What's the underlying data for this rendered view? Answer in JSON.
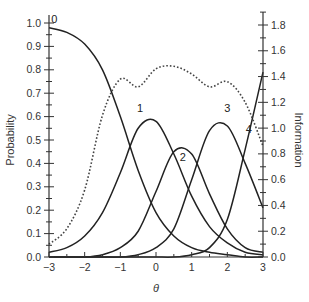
{
  "chart_data": {
    "type": "line",
    "title": "",
    "xlabel": "θ",
    "ylabel_left": "Probability",
    "ylabel_right": "Information",
    "xlim": [
      -3,
      3
    ],
    "ylim_left": [
      0,
      1.0
    ],
    "ylim_right": [
      0,
      1.9
    ],
    "x_ticks": [
      -3,
      -2,
      -1,
      0,
      1,
      2,
      3
    ],
    "x_tick_labels": [
      "−3",
      "−2",
      "−1",
      "0",
      "1",
      "2",
      "3"
    ],
    "y_left_ticks": [
      0.0,
      0.1,
      0.2,
      0.3,
      0.4,
      0.5,
      0.6,
      0.7,
      0.8,
      0.9,
      1.0
    ],
    "y_left_tick_labels": [
      "0.0",
      "0.1",
      "0.2",
      "0.3",
      "0.4",
      "0.5",
      "0.6",
      "0.7",
      "0.8",
      "0.9",
      "1.0"
    ],
    "y_right_ticks": [
      0.0,
      0.2,
      0.4,
      0.6,
      0.8,
      1.0,
      1.2,
      1.4,
      1.6,
      1.8
    ],
    "y_right_tick_labels": [
      "0.0",
      "0.2",
      "0.4",
      "0.6",
      "0.8",
      "1.0",
      "1.2",
      "1.4",
      "1.6",
      "1.8"
    ],
    "grid": false,
    "legend": "none (curves labeled inline)",
    "x": [
      -3.0,
      -2.5,
      -2.0,
      -1.5,
      -1.0,
      -0.5,
      0.0,
      0.5,
      1.0,
      1.5,
      2.0,
      2.5,
      3.0
    ],
    "series": [
      {
        "name": "0",
        "axis": "left",
        "style": "solid",
        "label_pos": [
          -2.85,
          1.0
        ],
        "values": [
          0.98,
          0.96,
          0.91,
          0.8,
          0.6,
          0.37,
          0.19,
          0.09,
          0.04,
          0.02,
          0.01,
          0.0,
          0.0
        ]
      },
      {
        "name": "1",
        "axis": "left",
        "style": "solid",
        "label_pos": [
          -0.45,
          0.62
        ],
        "values": [
          0.02,
          0.04,
          0.09,
          0.19,
          0.36,
          0.55,
          0.58,
          0.44,
          0.26,
          0.13,
          0.06,
          0.02,
          0.01
        ]
      },
      {
        "name": "2",
        "axis": "left",
        "style": "solid",
        "label_pos": [
          0.75,
          0.41
        ],
        "values": [
          0.0,
          0.0,
          0.0,
          0.01,
          0.04,
          0.11,
          0.28,
          0.45,
          0.44,
          0.27,
          0.12,
          0.04,
          0.02
        ]
      },
      {
        "name": "3",
        "axis": "left",
        "style": "solid",
        "label_pos": [
          2.0,
          0.62
        ],
        "values": [
          0.0,
          0.0,
          0.0,
          0.0,
          0.0,
          0.01,
          0.04,
          0.12,
          0.33,
          0.54,
          0.56,
          0.4,
          0.21
        ]
      },
      {
        "name": "4",
        "axis": "left",
        "style": "solid",
        "label_pos": [
          2.6,
          0.53
        ],
        "values": [
          0.0,
          0.0,
          0.0,
          0.0,
          0.0,
          0.0,
          0.0,
          0.0,
          0.01,
          0.04,
          0.16,
          0.46,
          0.79
        ]
      },
      {
        "name": "Information",
        "axis": "right",
        "style": "dotted",
        "values": [
          0.1,
          0.22,
          0.52,
          1.1,
          1.38,
          1.32,
          1.46,
          1.48,
          1.42,
          1.32,
          1.36,
          1.2,
          0.86
        ]
      }
    ]
  }
}
